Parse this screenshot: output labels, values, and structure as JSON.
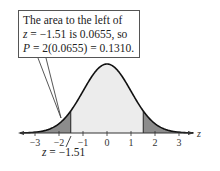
{
  "chart_data": {
    "type": "area",
    "title": "",
    "distribution": "standard normal",
    "xlabel": "z",
    "ylabel": "",
    "xlim": [
      -3.6,
      3.6
    ],
    "x_ticks": [
      -3,
      -2,
      -1,
      0,
      1,
      2,
      3
    ],
    "tick_labels": [
      "−3",
      "−2",
      "−1",
      "0",
      "1",
      "2",
      "3"
    ],
    "shaded_regions": [
      {
        "from": -3.6,
        "to": -1.51,
        "color": "#8c8c8c",
        "label": "left tail"
      },
      {
        "from": 1.51,
        "to": 3.6,
        "color": "#8c8c8c",
        "label": "right tail"
      }
    ],
    "unshaded_fill": "#ececec",
    "critical_value": -1.51,
    "left_area": 0.0655,
    "p_value": 0.131,
    "annotations": [
      "The area to the left of z = −1.51 is 0.0655, so P = 2(0.0655) = 0.1310.",
      "z = −1.51"
    ],
    "grid": false,
    "legend": "none"
  },
  "callout": {
    "line1": "The area to the left of",
    "line2_var": "z",
    "line2_rest": " = −1.51 is 0.0655, so",
    "line3_var": "P",
    "line3_rest": " = 2(0.0655) = 0.1310."
  },
  "axis": {
    "label": "z",
    "ticks": [
      "−3",
      "−2",
      "−1",
      "0",
      "1",
      "2",
      "3"
    ]
  },
  "zmark": {
    "var": "z",
    "rest": " = −1.51"
  }
}
